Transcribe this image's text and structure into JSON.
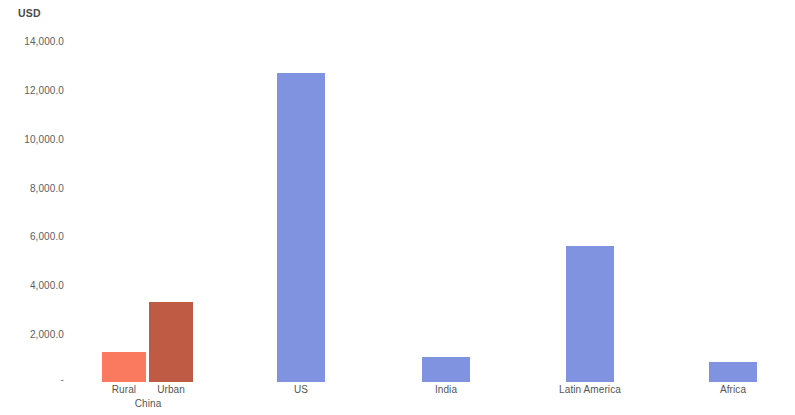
{
  "chart_data": {
    "type": "bar",
    "title": "",
    "subtitle": "",
    "xlabel": "",
    "ylabel": "USD",
    "unit_label": "USD",
    "categories": [
      "Rural",
      "Urban",
      "US",
      "India",
      "Latin America",
      "Africa"
    ],
    "group_labels": [
      "China",
      "",
      "",
      "",
      "",
      ""
    ],
    "values": [
      1200,
      3250,
      12500,
      1000,
      5500,
      800
    ],
    "ylim": [
      0,
      14000
    ],
    "ytick_values": [
      0,
      2000,
      4000,
      6000,
      8000,
      10000,
      12000,
      14000
    ],
    "ytick_labels": [
      "-",
      "2,000.0",
      "4,000.0",
      "6,000.0",
      "8,000.0",
      "10,000.0",
      "12,000.0",
      "14,000.0"
    ],
    "grid": false,
    "legend": "none",
    "bar_colors": [
      "#f97a5f",
      "#bf5a45",
      "#8093e0",
      "#8093e0",
      "#8093e0",
      "#8093e0"
    ],
    "series": [
      {
        "name": "USD",
        "points": [
          {
            "label": "Rural",
            "group": "China",
            "value": 1200,
            "color": "#f97a5f"
          },
          {
            "label": "Urban",
            "group": "China",
            "value": 3250,
            "color": "#bf5a45"
          },
          {
            "label": "US",
            "group": "",
            "value": 12500,
            "color": "#8093e0"
          },
          {
            "label": "India",
            "group": "",
            "value": 1000,
            "color": "#8093e0"
          },
          {
            "label": "Latin America",
            "group": "",
            "value": 5500,
            "color": "#8093e0"
          },
          {
            "label": "Africa",
            "group": "",
            "value": 800,
            "color": "#8093e0"
          }
        ]
      }
    ]
  },
  "colors": {
    "rural": "#f97a5f",
    "urban": "#bf5a45",
    "region": "#8093e0",
    "text": "#555555",
    "background": "#ffffff"
  }
}
